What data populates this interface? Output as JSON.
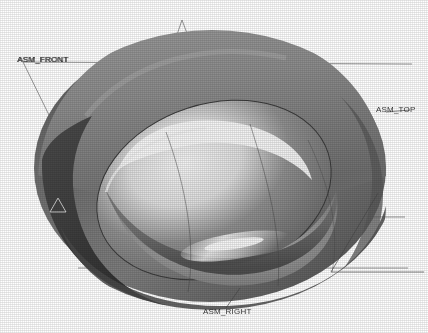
{
  "view": {
    "background_color": "#ffffff",
    "render_style": "shaded-grayscale",
    "model_description": "toroidal tire / ring solid model, isometric shaded view"
  },
  "model": {
    "outer_body_color": "#8a8a8a",
    "outer_body_shadow_color": "#5e5e5e",
    "inner_bore_color": "#6f6f6f",
    "highlight_color": "#e8e8e8",
    "edge_color": "#3a3a3a",
    "dark_rim_color": "#4a4a4a"
  },
  "datum_planes": [
    {
      "id": "asm-front",
      "label": "ASM_FRONT",
      "overlap_label": "ASM_FRONT",
      "position": "left",
      "color": "#2b2b2b"
    },
    {
      "id": "asm-top",
      "label": "ASM_TOP",
      "position": "right",
      "color": "#2b2b2b"
    },
    {
      "id": "asm-right",
      "label": "ASM_RIGHT",
      "position": "bottom",
      "color": "#2b2b2b"
    }
  ],
  "datum_marker": {
    "label": "A",
    "color": "#2b2b2b"
  },
  "graphics": {
    "datum_line_color": "#555555",
    "datum_line_width": 0.7
  }
}
